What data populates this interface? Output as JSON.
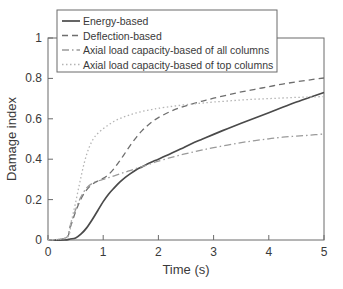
{
  "chart_data": {
    "type": "line",
    "title": "",
    "xlabel": "Time (s)",
    "ylabel": "Damage index",
    "xlim": [
      0,
      5
    ],
    "ylim": [
      0,
      1
    ],
    "xticks": [
      "0",
      "1",
      "2",
      "3",
      "4",
      "5"
    ],
    "yticks": [
      "0",
      "0.2",
      "0.4",
      "0.6",
      "0.8",
      "1"
    ],
    "grid": false,
    "legend_position": "top-center",
    "series": [
      {
        "name": "Energy-based",
        "style": "solid",
        "color": "#4a4a4a",
        "x": [
          0.0,
          0.3,
          0.4,
          0.5,
          0.6,
          0.7,
          0.8,
          0.9,
          1.0,
          1.1,
          1.2,
          1.3,
          1.4,
          1.5,
          1.6,
          1.7,
          1.8,
          1.9,
          2.0,
          2.2,
          2.4,
          2.6,
          2.8,
          3.0,
          3.25,
          3.5,
          3.75,
          4.0,
          4.25,
          4.5,
          4.75,
          5.0
        ],
        "y": [
          0.0,
          0.0,
          0.005,
          0.01,
          0.03,
          0.06,
          0.1,
          0.145,
          0.19,
          0.228,
          0.258,
          0.286,
          0.31,
          0.33,
          0.348,
          0.362,
          0.376,
          0.389,
          0.4,
          0.425,
          0.45,
          0.477,
          0.5,
          0.523,
          0.551,
          0.578,
          0.604,
          0.63,
          0.657,
          0.683,
          0.707,
          0.73
        ]
      },
      {
        "name": "Deflection-based",
        "style": "dashed",
        "color": "#6e6e6e",
        "x": [
          0.0,
          0.33,
          0.4,
          0.5,
          0.6,
          0.7,
          0.8,
          0.9,
          1.0,
          1.1,
          1.2,
          1.3,
          1.4,
          1.5,
          1.6,
          1.7,
          1.8,
          1.9,
          2.0,
          2.2,
          2.4,
          2.6,
          2.8,
          3.0,
          3.25,
          3.5,
          3.75,
          4.0,
          4.25,
          4.5,
          4.75,
          5.0
        ],
        "y": [
          0.0,
          0.01,
          0.06,
          0.14,
          0.205,
          0.248,
          0.275,
          0.292,
          0.305,
          0.325,
          0.355,
          0.392,
          0.432,
          0.472,
          0.508,
          0.54,
          0.566,
          0.588,
          0.606,
          0.634,
          0.656,
          0.673,
          0.688,
          0.702,
          0.718,
          0.733,
          0.746,
          0.759,
          0.772,
          0.783,
          0.793,
          0.802
        ]
      },
      {
        "name": "Axial load capacity-based of all columns",
        "style": "dashdot",
        "color": "#9a9a9a",
        "x": [
          0.0,
          0.33,
          0.4,
          0.5,
          0.6,
          0.7,
          0.8,
          0.9,
          1.0,
          1.1,
          1.2,
          1.3,
          1.4,
          1.5,
          1.6,
          1.7,
          1.8,
          1.9,
          2.0,
          2.2,
          2.4,
          2.6,
          2.8,
          3.0,
          3.25,
          3.5,
          3.75,
          4.0,
          4.25,
          4.5,
          4.75,
          5.0
        ],
        "y": [
          0.0,
          0.012,
          0.07,
          0.15,
          0.215,
          0.258,
          0.28,
          0.292,
          0.3,
          0.309,
          0.318,
          0.327,
          0.336,
          0.345,
          0.354,
          0.363,
          0.372,
          0.381,
          0.39,
          0.406,
          0.421,
          0.434,
          0.446,
          0.457,
          0.47,
          0.482,
          0.492,
          0.501,
          0.509,
          0.514,
          0.519,
          0.525
        ]
      },
      {
        "name": "Axial load capacity-based of top columns",
        "style": "dotted",
        "color": "#b4b4b4",
        "x": [
          0.0,
          0.35,
          0.42,
          0.5,
          0.58,
          0.66,
          0.74,
          0.82,
          0.9,
          1.0,
          1.1,
          1.2,
          1.3,
          1.4,
          1.5,
          1.6,
          1.7,
          1.8,
          1.9,
          2.0,
          2.2,
          2.4,
          2.6,
          2.8,
          3.0,
          3.25,
          3.5,
          3.75,
          4.0,
          4.25,
          4.5,
          4.75,
          5.0
        ],
        "y": [
          0.0,
          0.015,
          0.09,
          0.185,
          0.29,
          0.385,
          0.455,
          0.5,
          0.527,
          0.551,
          0.571,
          0.588,
          0.601,
          0.612,
          0.621,
          0.629,
          0.636,
          0.642,
          0.647,
          0.652,
          0.66,
          0.667,
          0.673,
          0.678,
          0.683,
          0.688,
          0.693,
          0.697,
          0.7,
          0.703,
          0.706,
          0.708,
          0.71
        ]
      }
    ]
  }
}
